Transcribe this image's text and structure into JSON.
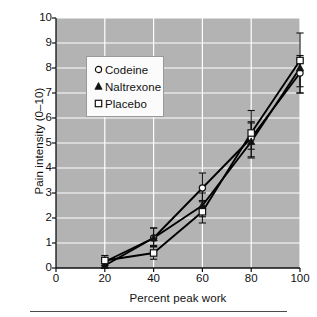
{
  "chart_data": {
    "type": "line",
    "title": "",
    "subtitle": "",
    "xlabel": "Percent peak work",
    "ylabel": "Pain intensity (0–10)",
    "x": [
      20,
      40,
      60,
      80,
      100
    ],
    "xlim": [
      0,
      100
    ],
    "ylim": [
      0,
      10
    ],
    "xticks": [
      0,
      20,
      40,
      60,
      80,
      100
    ],
    "yticks": [
      0,
      1,
      2,
      3,
      4,
      5,
      6,
      7,
      8,
      9,
      10
    ],
    "grid": true,
    "grid_color": "#ffffff",
    "plot_background": "#b3b3b3",
    "legend_position": "upper-left-inside",
    "series": [
      {
        "name": "Codeine",
        "marker": "open-circle",
        "values": [
          0.25,
          1.2,
          3.2,
          5.2,
          7.8
        ],
        "err_low": [
          0.15,
          0.35,
          0.5,
          0.45,
          0.8
        ],
        "err_high": [
          0.15,
          0.4,
          0.6,
          0.6,
          0.55
        ]
      },
      {
        "name": "Naltrexone",
        "marker": "filled-triangle",
        "values": [
          0.1,
          1.2,
          2.5,
          5.05,
          8.0
        ],
        "err_low": [
          0.1,
          0.35,
          0.45,
          0.6,
          0.75
        ],
        "err_high": [
          0.15,
          0.4,
          0.5,
          0.8,
          0.5
        ]
      },
      {
        "name": "Placebo",
        "marker": "open-square",
        "values": [
          0.3,
          0.6,
          2.25,
          5.4,
          8.3
        ],
        "err_low": [
          0.2,
          0.25,
          0.45,
          1.0,
          1.3
        ],
        "err_high": [
          0.2,
          0.3,
          0.4,
          0.9,
          1.1
        ]
      }
    ]
  },
  "axes": {
    "y_label": "Pain intensity (0–10)",
    "x_label": "Percent peak work",
    "y_tick_labels": [
      "0",
      "1",
      "2",
      "3",
      "4",
      "5",
      "6",
      "7",
      "8",
      "9",
      "10"
    ],
    "x_tick_labels": [
      "0",
      "20",
      "40",
      "60",
      "80",
      "100"
    ]
  },
  "legend": {
    "entries": [
      {
        "label": "Codeine",
        "marker": "open-circle"
      },
      {
        "label": "Naltrexone",
        "marker": "filled-triangle"
      },
      {
        "label": "Placebo",
        "marker": "open-square"
      }
    ]
  },
  "colors": {
    "plot_area": "#b3b3b3",
    "gridline": "#ffffff",
    "series_line": "#000000",
    "text": "#111111",
    "rule": "#4a4a4a"
  }
}
